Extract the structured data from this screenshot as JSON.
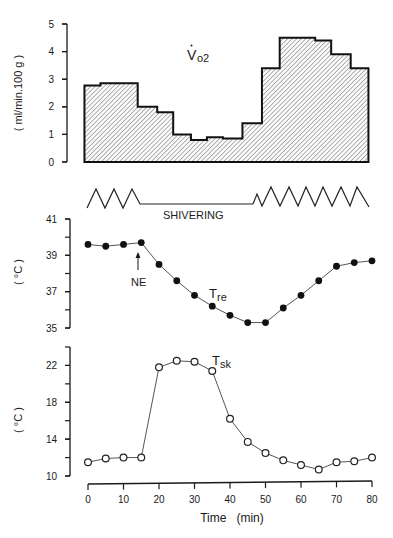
{
  "chart_data": [
    {
      "type": "area",
      "subtype": "step",
      "title": "V̇o2",
      "label": {
        "main": "V",
        "dot": "·",
        "sub": "o2"
      },
      "xlabel": "Time (min)",
      "ylabel": "( ml/min.100 g )",
      "ylim": [
        0,
        5
      ],
      "yticks": [
        "0",
        "1",
        "2",
        "3",
        "4",
        "5"
      ],
      "fill": "diagonal hatch",
      "steps": [
        {
          "x_start": -1,
          "x_end": 3.5,
          "value": 2.77
        },
        {
          "x_start": 3.5,
          "x_end": 14,
          "value": 2.85
        },
        {
          "x_start": 14,
          "x_end": 19.5,
          "value": 2.0
        },
        {
          "x_start": 19.5,
          "x_end": 24,
          "value": 1.8
        },
        {
          "x_start": 24,
          "x_end": 29,
          "value": 1.0
        },
        {
          "x_start": 29,
          "x_end": 33.5,
          "value": 0.8
        },
        {
          "x_start": 33.5,
          "x_end": 38,
          "value": 0.9
        },
        {
          "x_start": 38,
          "x_end": 43.5,
          "value": 0.85
        },
        {
          "x_start": 43.5,
          "x_end": 49,
          "value": 1.4
        },
        {
          "x_start": 49,
          "x_end": 54,
          "value": 3.4
        },
        {
          "x_start": 54,
          "x_end": 64,
          "value": 4.5
        },
        {
          "x_start": 64,
          "x_end": 68.5,
          "value": 4.4
        },
        {
          "x_start": 68.5,
          "x_end": 74,
          "value": 3.9
        },
        {
          "x_start": 74,
          "x_end": 79,
          "value": 3.4
        }
      ]
    },
    {
      "type": "annotation-track",
      "label": "SHIVERING",
      "segments": [
        {
          "state": "shivering",
          "x_start": 0,
          "x_end": 14
        },
        {
          "state": "no shivering",
          "x_start": 14,
          "x_end": 47
        },
        {
          "state": "shivering",
          "x_start": 47,
          "x_end": 79
        }
      ]
    },
    {
      "type": "line",
      "series_name": "Tre",
      "label": {
        "main": "T",
        "sub": "re"
      },
      "marker": "filled circle",
      "ylabel": "( °C )",
      "ylim": [
        35,
        41
      ],
      "yticks": [
        "35",
        "37",
        "39",
        "41"
      ],
      "annotations": [
        {
          "text": "NE",
          "x": 15,
          "arrow": "up"
        }
      ],
      "x": [
        0,
        5,
        10,
        15,
        20,
        25,
        30,
        35,
        40,
        45,
        50,
        55,
        60,
        65,
        70,
        75,
        80
      ],
      "values": [
        39.6,
        39.5,
        39.6,
        39.7,
        38.5,
        37.6,
        36.8,
        36.2,
        35.7,
        35.3,
        35.3,
        36.1,
        36.8,
        37.6,
        38.4,
        38.6,
        38.7
      ]
    },
    {
      "type": "line",
      "series_name": "Tsk",
      "label": {
        "main": "T",
        "sub": "sk"
      },
      "marker": "open circle",
      "xlabel": "Time   (min)",
      "ylabel": "( °C )",
      "ylim": [
        10,
        24
      ],
      "yticks": [
        "10",
        "14",
        "18",
        "22"
      ],
      "xticks": [
        "0",
        "10",
        "20",
        "30",
        "40",
        "50",
        "60",
        "70",
        "80"
      ],
      "xlim": [
        0,
        80
      ],
      "x": [
        0,
        5,
        10,
        15,
        20,
        25,
        30,
        35,
        40,
        45,
        50,
        55,
        60,
        65,
        70,
        75,
        80
      ],
      "values": [
        11.5,
        11.9,
        12.0,
        12.0,
        21.8,
        22.5,
        22.4,
        21.4,
        16.2,
        13.7,
        12.5,
        11.7,
        11.2,
        10.7,
        11.5,
        11.6,
        12.0
      ]
    }
  ],
  "labels": {
    "vo2_main": "V",
    "vo2_sub": "o2",
    "vo2_ylabel": "( ml/min.100 g )",
    "shivering": "SHIVERING",
    "tre_main": "T",
    "tre_sub": "re",
    "tre_ylabel": "( °C )",
    "ne": "NE",
    "tsk_main": "T",
    "tsk_sub": "sk",
    "tsk_ylabel": "( °C )",
    "xlabel": "Time   (min)"
  }
}
